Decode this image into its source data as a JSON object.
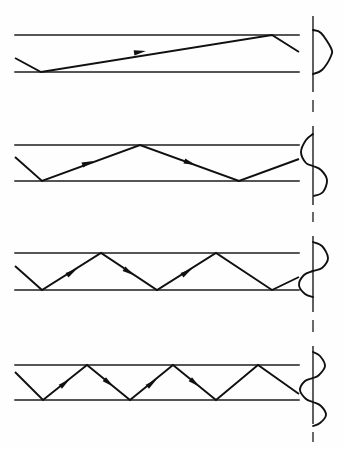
{
  "figure": {
    "title": "Waveguide ray paths and transverse mode field profiles",
    "background_color": "#fefefe",
    "ink_color": "#101010",
    "width": 345,
    "height": 449
  },
  "geometry": {
    "guide_x_start": 15,
    "guide_x_end": 299,
    "axis_x": 313,
    "axis_half_width": 22
  },
  "panels": [
    {
      "name": "mode-panel-1",
      "mode_order": 1,
      "lobes": 1,
      "bounce_count": 1,
      "label": "Lowest-order mode: shallowest ray angle, single-lobe field",
      "guide": {
        "top_y": 35,
        "bottom_y": 72
      },
      "ray_points": "15,58 41,72 272,35 299,52",
      "arrows": [
        {
          "x": 140,
          "y": 52,
          "angle": -9
        }
      ],
      "axis": {
        "y_top": 16,
        "y_bottom": 92
      },
      "axis_stub": {
        "y_top": 100,
        "y_bottom": 112
      },
      "curve": "313,30 321,33 331,48 331,56 322,70 313,74"
    },
    {
      "name": "mode-panel-2",
      "mode_order": 2,
      "lobes": 2,
      "bounce_count": 3,
      "label": "Second-order mode: steeper ray angle, two-lobe field",
      "guide": {
        "top_y": 145,
        "bottom_y": 181
      },
      "ray_points": "15,157 42,181 140,145 239,181 299,159",
      "arrows": [
        {
          "x": 88,
          "y": 163,
          "angle": -20
        },
        {
          "x": 190,
          "y": 163,
          "angle": 20
        }
      ],
      "axis": {
        "y_top": 126,
        "y_bottom": 205
      },
      "axis_stub": {
        "y_top": 212,
        "y_bottom": 222
      },
      "curve": "313,134 306,140 301,152 306,163 313,166 321,170 327,180 323,192 314,196"
    },
    {
      "name": "mode-panel-3",
      "mode_order": 3,
      "lobes": 3,
      "bounce_count": 5,
      "label": "Third-order mode: steeper still, three-lobe field",
      "guide": {
        "top_y": 253,
        "bottom_y": 290
      },
      "ray_points": "15,266 42,290 101,253 157,290 216,253 272,290 299,277",
      "arrows": [
        {
          "x": 72,
          "y": 272,
          "angle": -33
        },
        {
          "x": 129,
          "y": 272,
          "angle": 33
        },
        {
          "x": 187,
          "y": 272,
          "angle": -33
        }
      ],
      "axis": {
        "y_top": 236,
        "y_bottom": 312
      },
      "axis_stub": {
        "y_top": 320,
        "y_bottom": 332
      },
      "curve": "313,242 322,246 328,258 322,268 313,271 304,275 299,285 305,294 313,297"
    },
    {
      "name": "mode-panel-4",
      "mode_order": 4,
      "lobes": 4,
      "bounce_count": 7,
      "label": "Fourth-order mode: steepest ray angle, four-lobe field",
      "guide": {
        "top_y": 365,
        "bottom_y": 400
      },
      "ray_points": "15,372 43,400 87,365 130,400 173,365 216,400 258,365 299,394",
      "arrows": [
        {
          "x": 65,
          "y": 383,
          "angle": -39
        },
        {
          "x": 109,
          "y": 383,
          "angle": 39
        },
        {
          "x": 152,
          "y": 383,
          "angle": -39
        },
        {
          "x": 195,
          "y": 383,
          "angle": 39
        }
      ],
      "axis": {
        "y_top": 346,
        "y_bottom": 424
      },
      "axis_stub": {
        "y_top": 432,
        "y_bottom": 442
      },
      "curve": "313,352 320,356 325,366 319,375 313,378 305,381 300,390 306,399 313,402 321,406 326,415 320,423 313,426"
    }
  ]
}
